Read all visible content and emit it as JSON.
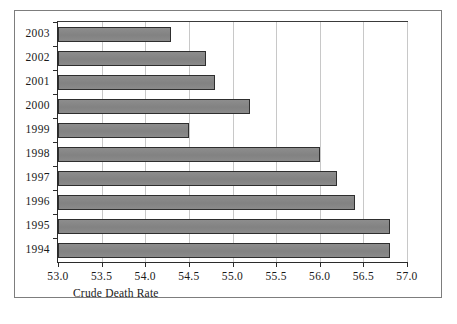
{
  "figure": {
    "frame_border_color": "#7d7d7d",
    "background": "#ffffff"
  },
  "chart_data": {
    "type": "bar",
    "orientation": "horizontal",
    "title": "",
    "subtitle": "",
    "xlabel": "Crude Death Rate",
    "ylabel": "",
    "categories": [
      "2003",
      "2002",
      "2001",
      "2000",
      "1999",
      "1998",
      "1997",
      "1996",
      "1995",
      "1994"
    ],
    "values": [
      54.3,
      54.7,
      54.8,
      55.2,
      54.5,
      56.0,
      56.2,
      56.4,
      56.8,
      56.8
    ],
    "xlim": [
      53.0,
      57.0
    ],
    "xticks": [
      "53.0",
      "53.5",
      "54.0",
      "54.5",
      "55.0",
      "55.5",
      "56.0",
      "56.5",
      "57.0"
    ],
    "xtick_values": [
      53.0,
      53.5,
      54.0,
      54.5,
      55.0,
      55.5,
      56.0,
      56.5,
      57.0
    ],
    "grid": true,
    "grid_axis": "x",
    "grid_color": "#c8c8c8",
    "legend": null,
    "bar_fill_color": "#878787",
    "bar_border_color": "#2e2e2e",
    "axis_color": "#2b2b2b"
  }
}
